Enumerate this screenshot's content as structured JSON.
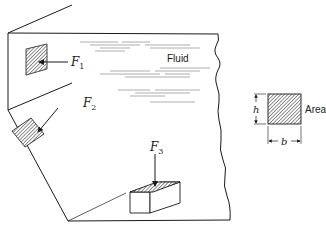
{
  "diagram": {
    "title": "",
    "fluid_label": "Fluid",
    "forces": [
      {
        "symbol": "F",
        "subscript": "1"
      },
      {
        "symbol": "F",
        "subscript": "2"
      },
      {
        "symbol": "F",
        "subscript": "3"
      }
    ],
    "legend": {
      "area_label": "Area",
      "height_label": "h",
      "width_label": "b"
    },
    "colors": {
      "line": "#1a1a1a",
      "hatch": "#555555",
      "background": "#ffffff"
    }
  }
}
